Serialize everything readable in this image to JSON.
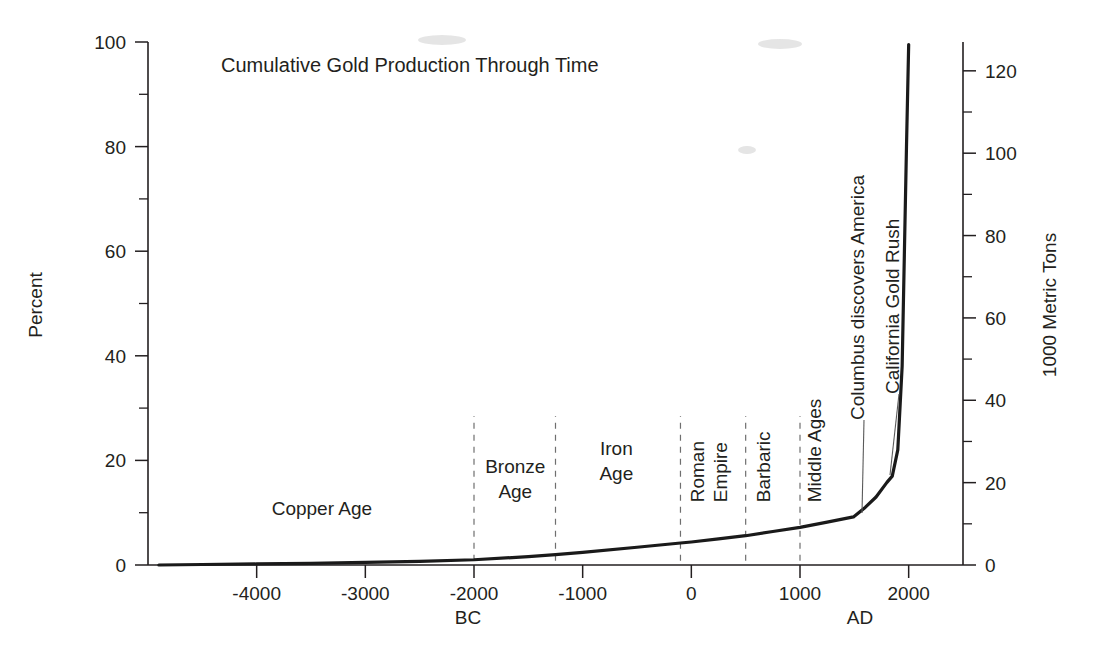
{
  "chart_data": {
    "type": "line",
    "title": "Cumulative Gold Production Through Time",
    "xlabel_left": "BC",
    "xlabel_right": "AD",
    "ylabel": "Percent",
    "ylabel_right": "1000 Metric Tons",
    "xlim": [
      -5000,
      2500
    ],
    "ylim": [
      0,
      100
    ],
    "ylim_right": [
      0,
      127
    ],
    "grid": false,
    "legend": null,
    "x_ticks": [
      -4000,
      -3000,
      -2000,
      -1000,
      0,
      1000,
      2000
    ],
    "x_tick_labels": [
      "-4000",
      "-3000",
      "-2000",
      "-1000",
      "0",
      "1000",
      "2000"
    ],
    "y_ticks": [
      0,
      20,
      40,
      60,
      80,
      100
    ],
    "y_tick_labels": [
      "0",
      "20",
      "40",
      "60",
      "80",
      "100"
    ],
    "y_minor_ticks": [
      10,
      30,
      50,
      70,
      90
    ],
    "y_right_ticks": [
      0,
      20,
      40,
      60,
      80,
      100,
      120
    ],
    "y_right_tick_labels": [
      "0",
      "20",
      "40",
      "60",
      "80",
      "100",
      "120"
    ],
    "y_right_minor_ticks": [
      10,
      30,
      50,
      70,
      90,
      110
    ],
    "series": [
      {
        "name": "Cumulative gold production",
        "x": [
          -4900,
          -4500,
          -4000,
          -3500,
          -3000,
          -2500,
          -2000,
          -1500,
          -1250,
          -1000,
          -500,
          -100,
          0,
          250,
          500,
          750,
          1000,
          1250,
          1492,
          1600,
          1700,
          1800,
          1849,
          1900,
          1940,
          1980,
          2000
        ],
        "y": [
          0.0,
          0.1,
          0.2,
          0.3,
          0.5,
          0.7,
          1.0,
          1.6,
          2.0,
          2.4,
          3.4,
          4.2,
          4.4,
          5.0,
          5.6,
          6.4,
          7.2,
          8.2,
          9.2,
          11.0,
          13.0,
          15.8,
          17.0,
          22.0,
          38.0,
          80.0,
          99.5
        ]
      }
    ],
    "era_bands": [
      {
        "label": "Copper Age",
        "orientation": "horizontal",
        "x_center": -3400,
        "y_pos": 9.5
      },
      {
        "label": "Bronze Age",
        "orientation": "horizontal",
        "x_center": -1620,
        "y_pos": 17.5
      },
      {
        "label": "Iron Age",
        "orientation": "horizontal",
        "x_center": -690,
        "y_pos": 21.0
      },
      {
        "label": "Roman Empire",
        "orientation": "vertical",
        "x_center": 200,
        "y_pos": 12.0
      },
      {
        "label": "Barbaric",
        "orientation": "vertical",
        "x_center": 720,
        "y_pos": 12.0
      },
      {
        "label": "Middle Ages",
        "orientation": "vertical",
        "x_center": 1190,
        "y_pos": 12.0
      }
    ],
    "era_dividers": [
      -2000,
      -1250,
      -100,
      500,
      1000
    ],
    "annotations": [
      {
        "label": "Columbus discovers America",
        "x": 1492,
        "y": 9.2,
        "orientation": "vertical"
      },
      {
        "label": "California Gold Rush",
        "x": 1849,
        "y": 17.0,
        "orientation": "vertical"
      }
    ]
  },
  "figure": {
    "background": "#ffffff",
    "ink_color": "#231f20",
    "curve_color": "#1a1a1a",
    "divider_color": "#6f6f6f"
  }
}
